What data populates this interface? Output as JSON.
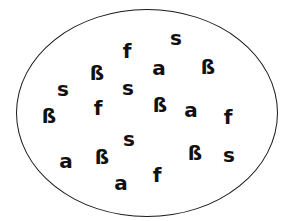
{
  "diagram": {
    "type": "set",
    "shape": "ellipse",
    "border_color": "#1a1a1a",
    "text_color": "#111111",
    "elements": [
      {
        "symbol": "ß",
        "x": 97,
        "y": 73
      },
      {
        "symbol": "f",
        "x": 127,
        "y": 51
      },
      {
        "symbol": "s",
        "x": 176,
        "y": 38
      },
      {
        "symbol": "a",
        "x": 159,
        "y": 68
      },
      {
        "symbol": "ß",
        "x": 208,
        "y": 67
      },
      {
        "symbol": "s",
        "x": 63,
        "y": 89
      },
      {
        "symbol": "s",
        "x": 128,
        "y": 88
      },
      {
        "symbol": "ß",
        "x": 49,
        "y": 116
      },
      {
        "symbol": "f",
        "x": 98,
        "y": 108
      },
      {
        "symbol": "ß",
        "x": 160,
        "y": 105
      },
      {
        "symbol": "a",
        "x": 191,
        "y": 110
      },
      {
        "symbol": "f",
        "x": 228,
        "y": 117
      },
      {
        "symbol": "s",
        "x": 129,
        "y": 139
      },
      {
        "symbol": "a",
        "x": 66,
        "y": 161
      },
      {
        "symbol": "ß",
        "x": 102,
        "y": 157
      },
      {
        "symbol": "ß",
        "x": 195,
        "y": 153
      },
      {
        "symbol": "s",
        "x": 229,
        "y": 155
      },
      {
        "symbol": "a",
        "x": 121,
        "y": 183
      },
      {
        "symbol": "f",
        "x": 157,
        "y": 175
      }
    ]
  }
}
